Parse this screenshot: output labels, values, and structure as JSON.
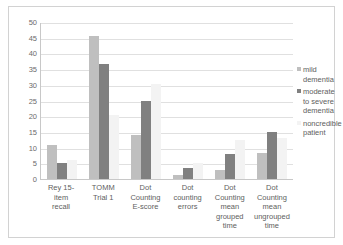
{
  "chart_data": {
    "type": "bar",
    "title": "",
    "xlabel": "",
    "ylabel": "",
    "ylim": [
      0,
      50
    ],
    "yticks": [
      50,
      45,
      40,
      35,
      30,
      25,
      20,
      15,
      10,
      5,
      0
    ],
    "grid": true,
    "legend_position": "right",
    "categories": [
      "Rey 15-item recall",
      "TOMM Trial 1",
      "Dot Counting E-score",
      "Dot counting errors",
      "Dot Counting mean grouped time",
      "Dot Counting mean ungrouped time"
    ],
    "category_lines": [
      [
        "Rey 15-item",
        "recall"
      ],
      [
        "TOMM",
        "Trial 1"
      ],
      [
        "Dot",
        "Counting",
        "E-score"
      ],
      [
        "Dot",
        "counting",
        "errors"
      ],
      [
        "Dot",
        "Counting",
        "mean",
        "grouped",
        "time"
      ],
      [
        "Dot",
        "Counting",
        "mean",
        "ungrouped",
        "time"
      ]
    ],
    "series": [
      {
        "name": "mild dementia",
        "color": "#bfbfbf",
        "values": [
          10.8,
          45.4,
          14.1,
          1.3,
          2.9,
          8.2
        ]
      },
      {
        "name": "moderate to severe dementia",
        "color": "#808080",
        "values": [
          5.0,
          36.7,
          25.0,
          3.6,
          8.0,
          15.1
        ]
      },
      {
        "name": "noncredible patient",
        "color": "#f3f3f3",
        "values": [
          6.0,
          20.5,
          30.4,
          5.0,
          12.4,
          13.0
        ]
      }
    ]
  },
  "legend": {
    "entries": [
      {
        "label": "mild dementia",
        "lines": [
          "mild dementia"
        ]
      },
      {
        "label": "moderate to severe dementia",
        "lines": [
          "moderate",
          "to severe",
          "dementia"
        ]
      },
      {
        "label": "noncredible patient",
        "lines": [
          "noncredible",
          "patient"
        ]
      }
    ]
  }
}
